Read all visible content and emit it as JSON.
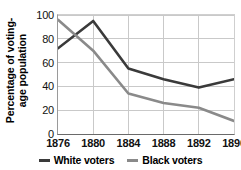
{
  "chart_data": {
    "type": "line",
    "title": "",
    "xlabel": "",
    "ylabel_line1": "Percentage of voting-",
    "ylabel_line2": "age population",
    "categories": [
      "1876",
      "1880",
      "1884",
      "1888",
      "1892",
      "1896"
    ],
    "series": [
      {
        "name": "White voters",
        "color": "#3a3a3a",
        "values": [
          72,
          95,
          55,
          46,
          39,
          46
        ]
      },
      {
        "name": "Black voters",
        "color": "#8a8a8a",
        "values": [
          96,
          70,
          34,
          26,
          22,
          11
        ]
      }
    ],
    "ylim": [
      0,
      100
    ],
    "yticks": [
      "0",
      "20",
      "40",
      "60",
      "80",
      "100"
    ],
    "ytick_values": [
      0,
      20,
      40,
      60,
      80,
      100
    ],
    "grid": true,
    "legend_position": "bottom"
  },
  "colors": {
    "white_voters_line": "#3a3a3a",
    "black_voters_line": "#8a8a8a",
    "gridline": "#c9c9c9",
    "axis": "#6a6a6a",
    "background": "#ffffff"
  }
}
